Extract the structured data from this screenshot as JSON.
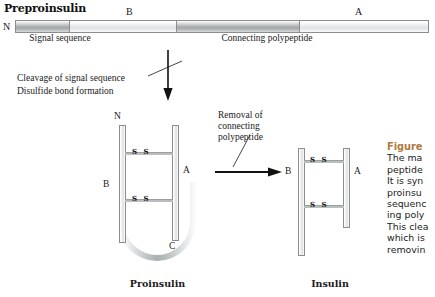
{
  "figure": {
    "title": "Preproinsulin",
    "chain_bar": {
      "terminus_label": "N",
      "segments": [
        {
          "name": "signal-sequence",
          "shade": "dark",
          "width_pct": 13.0
        },
        {
          "name": "b-chain",
          "shade": "light",
          "width_pct": 26.0
        },
        {
          "name": "connecting-polypeptide",
          "shade": "dark",
          "width_pct": 30.0
        },
        {
          "name": "a-chain",
          "shade": "light",
          "width_pct": 31.0
        }
      ],
      "labels": {
        "b": "B",
        "a": "A",
        "signal_sequence": "Signal\nsequence",
        "connecting_polypeptide": "Connecting\npolypeptide"
      }
    },
    "step1": {
      "line1": "Cleavage of signal sequence",
      "line2": "Disulfide bond formation"
    },
    "step2": {
      "label": "Removal of\nconnecting\npolypeptide"
    },
    "proinsulin": {
      "caption": "Proinsulin",
      "n_terminus": "N",
      "c_terminus": "C",
      "b_chain": "B",
      "a_chain": "A",
      "disulfide_1": "S S",
      "disulfide_2": "S S"
    },
    "insulin": {
      "caption": "Insulin",
      "b_chain": "B",
      "a_chain": "A",
      "disulfide_1": "S S",
      "disulfide_2": "S S"
    },
    "caption_panel": {
      "heading": "Figure",
      "body": "The ma\npeptide\nIt is syn\nproinsu\nsequenc\ning poly\nThis clea\nwhich is\nremovin"
    }
  },
  "colors": {
    "caption_heading": "#b07a3e",
    "text": "#1a1a1a",
    "rule": "#8d8d8d"
  }
}
